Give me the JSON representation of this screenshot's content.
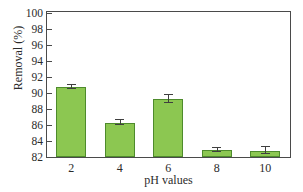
{
  "chart_data": {
    "type": "bar",
    "title": "",
    "subtitle": "",
    "xlabel": "pH values",
    "ylabel": "Removal (%)",
    "categories": [
      "2",
      "4",
      "6",
      "8",
      "10"
    ],
    "values": [
      90.7,
      86.3,
      89.2,
      82.9,
      82.8
    ],
    "errors": [
      0.25,
      0.3,
      0.5,
      0.25,
      0.45
    ],
    "series": [
      {
        "name": "Removal",
        "values": [
          90.7,
          86.3,
          89.2,
          82.9,
          82.8
        ],
        "errors": [
          0.25,
          0.3,
          0.5,
          0.25,
          0.45
        ]
      }
    ],
    "ylim": [
      82,
      100
    ],
    "ytick_values": [
      82,
      84,
      86,
      88,
      90,
      92,
      94,
      96,
      98,
      100
    ],
    "ytick_labels": [
      "82",
      "84",
      "86",
      "88",
      "90",
      "92",
      "94",
      "96",
      "98",
      "100"
    ],
    "xtick_labels": [
      "2",
      "4",
      "6",
      "8",
      "10"
    ],
    "grid": false,
    "legend": false,
    "legend_position": "none",
    "bar_fill_color": "#8cc751",
    "bar_edge_color": "#4e8b2c",
    "axis_color": "#4a4a4a",
    "error_bar_color": "#3f3f3f",
    "background_color": "#ffffff",
    "annotations": []
  }
}
